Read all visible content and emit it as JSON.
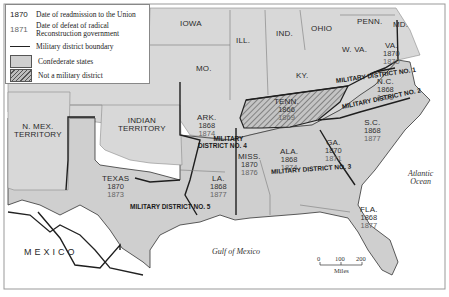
{
  "legend": {
    "readmission_sample": "1870",
    "readmission_label": "Date of readmission to the Union",
    "defeat_sample": "1871",
    "defeat_label_line1": "Date of defeat of radical",
    "defeat_label_line2": "Reconstruction government",
    "boundary_label": "Military district boundary",
    "confederate_label": "Confederate states",
    "not_district_label": "Not a military district"
  },
  "non_confederate": {
    "iowa": "IOWA",
    "ill": "ILL.",
    "ind": "IND.",
    "ohio": "OHIO",
    "penn": "PENN.",
    "md": "MD.",
    "mo": "MO.",
    "ky": "KY.",
    "wva": "W. VA.",
    "nmex_line1": "N. MEX.",
    "nmex_line2": "TERRITORY",
    "indian_line1": "INDIAN",
    "indian_line2": "TERRITORY"
  },
  "states": [
    {
      "id": "va",
      "name": "VA.",
      "readmitted": "1870",
      "defeat": "1870",
      "district": "1"
    },
    {
      "id": "nc",
      "name": "N.C.",
      "readmitted": "1868",
      "defeat": "1870",
      "district": "2"
    },
    {
      "id": "sc",
      "name": "S.C.",
      "readmitted": "1868",
      "defeat": "1877",
      "district": "2"
    },
    {
      "id": "ga",
      "name": "GA.",
      "readmitted": "1870",
      "defeat": "1871",
      "district": "3"
    },
    {
      "id": "ala",
      "name": "ALA.",
      "readmitted": "1868",
      "defeat": "1874",
      "district": "3"
    },
    {
      "id": "fla",
      "name": "FLA.",
      "readmitted": "1868",
      "defeat": "1877",
      "district": "3"
    },
    {
      "id": "miss",
      "name": "MISS.",
      "readmitted": "1870",
      "defeat": "1876",
      "district": "4"
    },
    {
      "id": "ark",
      "name": "ARK.",
      "readmitted": "1868",
      "defeat": "1874",
      "district": "4"
    },
    {
      "id": "la",
      "name": "LA.",
      "readmitted": "1868",
      "defeat": "1877",
      "district": "5"
    },
    {
      "id": "texas",
      "name": "TEXAS",
      "readmitted": "1870",
      "defeat": "1873",
      "district": "5"
    },
    {
      "id": "tenn",
      "name": "TENN.",
      "readmitted": "1866",
      "defeat": "1869",
      "district": "none"
    }
  ],
  "districts": {
    "d1": "MILITARY DISTRICT NO. 1",
    "d2": "MILITARY DISTRICT NO. 2",
    "d3": "MILITARY DISTRICT NO. 3",
    "d4_line1": "MILITARY",
    "d4_line2": "DISTRICT NO. 4",
    "d5": "MILITARY DISTRICT NO. 5"
  },
  "water": {
    "atlantic_line1": "Atlantic",
    "atlantic_line2": "Ocean",
    "gulf": "Gulf of Mexico"
  },
  "mexico": "MEXICO",
  "scale": {
    "t0": "0",
    "t1": "100",
    "t2": "200",
    "unit": "Miles"
  },
  "colors": {
    "confederate_fill": "#cfcfcf",
    "union_fill": "#d9d9d9",
    "water": "#ffffff",
    "boundary": "#1e1e1e"
  }
}
